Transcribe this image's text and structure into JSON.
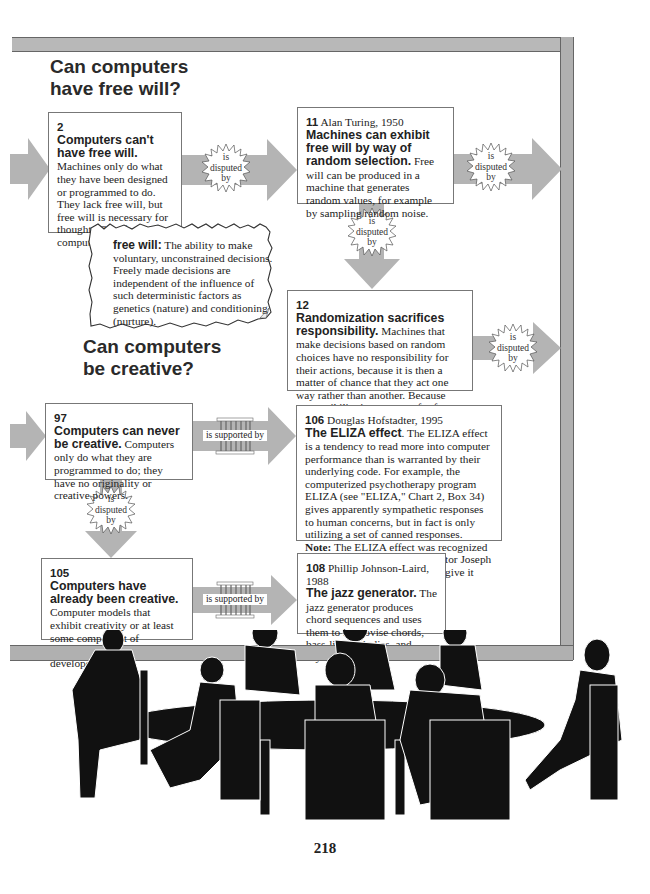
{
  "sections": [
    {
      "heading_line1": "Can computers",
      "heading_line2": "have free will?"
    },
    {
      "heading_line1": "Can computers",
      "heading_line2": "be creative?"
    }
  ],
  "boxes": {
    "b2": {
      "num": "2",
      "author": "",
      "title": "Computers can't have free will.",
      "body": "Machines only do what they have been designed or programmed to do.  They lack free will, but free will is necessary for thought.  Therefore, computers can't think."
    },
    "b11": {
      "num": "11",
      "author": "Alan Turing, 1950",
      "title": "Machines can exhibit free will by way of random selection.",
      "body": "Free will can be produced in a machine that generates random values, for example by sampling random noise."
    },
    "b12": {
      "num": "12",
      "author": "",
      "title": "Randomization sacrifices responsibility.",
      "body": "Machines that make decisions based on random choices have no responsibility for their actions, because it is then a matter of chance that they act one way rather than another.  Because responsibility is necessary for free will, such machines also lack free will."
    },
    "b97": {
      "num": "97",
      "author": "",
      "title": "Computers can never be creative.",
      "body": "Computers only do what they are programmed to do; they have no originality or creative powers."
    },
    "b106": {
      "num": "106",
      "author": "Douglas Hofstadter, 1995",
      "title": "The ELIZA effect",
      "body": ".  The ELIZA effect is a tendency to read more into computer performance than is warranted by their underlying code.  For example, the computerized psychotherapy program ELIZA (see \"ELIZA,\" Chart 2, Box 34) gives apparently sympathetic responses to human concerns, but in fact is only utilizing a set of canned responses.",
      "note_label": "Note:",
      "note_body": "The ELIZA effect was recognized and described by ELIZA's creator Joseph Weizenbaum, though he didn't give it that title."
    },
    "b105": {
      "num": "105",
      "author": "",
      "title": "Computers have already been creative.",
      "body": "Computer models that exhibit creativity or at least some component of creativity have already been developed."
    },
    "b108": {
      "num": "108",
      "author": "Phillip Johnson-Laird, 1988",
      "title": "The jazz generator.",
      "body": "The jazz generator produces chord sequences and uses them to improvise chords, bass-line melodies, and rhythms."
    }
  },
  "definition": {
    "term": "free will:",
    "text": "The ability to make voluntary, unconstrained decisions. Freely made decisions are independent of the influence of such deterministic factors as genetics (nature) and conditioning (nurture)."
  },
  "connectors": {
    "disputed": {
      "l1": "is",
      "l2": "disputed",
      "l3": "by"
    },
    "supported": "is supported by"
  },
  "page_number": "218",
  "colors": {
    "arrow": "#b4b4b4",
    "frame": "#b0b0b0",
    "border": "#777777"
  }
}
